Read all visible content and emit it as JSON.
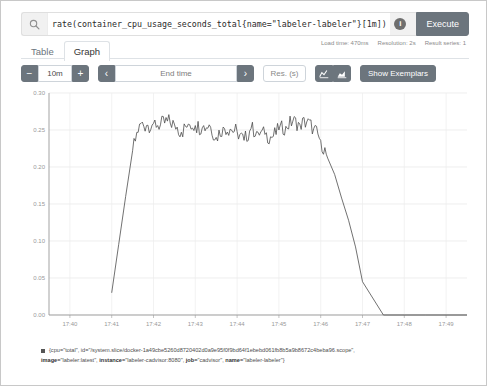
{
  "query": {
    "value": "rate(container_cpu_usage_seconds_total{name=\"labeler-labeler\"}[1m])",
    "search_icon": "search-icon",
    "info_icon": "i",
    "execute_label": "Execute"
  },
  "tabs": [
    {
      "label": "Table",
      "active": false
    },
    {
      "label": "Graph",
      "active": true
    }
  ],
  "stats": {
    "load_time": "Load time: 470ms",
    "resolution": "Resolution: 2s",
    "result_series": "Result series: 1"
  },
  "toolbar": {
    "decrease_label": "−",
    "range_value": "10m",
    "increase_label": "+",
    "prev_label": "‹",
    "end_time_placeholder": "End time",
    "next_label": "›",
    "resolution_placeholder": "Res. (s)",
    "line_chart_icon": "line-chart-icon",
    "stacked_chart_icon": "stacked-chart-icon",
    "show_exemplars_label": "Show Exemplars"
  },
  "legend": {
    "swatch_color": "#555555",
    "line1": "{cpu=\"total\", id=\"/system.slice/docker-1a49cbe5260d8720402d0a9e95f0f9bd64f1ebebd061fb8b5a9b8672c4beba96.scope\",",
    "line2_parts": [
      {
        "key": "image=",
        "val": "\"labeler:latest\", "
      },
      {
        "key": "instance=",
        "val": "\"labeler-cadvisor:8080\", "
      },
      {
        "key": "job=",
        "val": "\"cadvisor\", "
      },
      {
        "key": "name=",
        "val": "\"labeler-labeler\"}"
      }
    ]
  },
  "chart_data": {
    "type": "line",
    "title": "",
    "xlabel": "",
    "ylabel": "",
    "line_color": "#4d4d4d",
    "grid": true,
    "legend_position": "bottom",
    "ylim": [
      0.0,
      0.3
    ],
    "yticks": [
      "0.00",
      "0.05",
      "0.10",
      "0.15",
      "0.20",
      "0.25",
      "0.30"
    ],
    "ytick_values": [
      0.0,
      0.05,
      0.1,
      0.15,
      0.2,
      0.25,
      0.3
    ],
    "xlim": [
      "17:39:30",
      "17:49:30"
    ],
    "xticks": [
      "17:40",
      "17:41",
      "17:42",
      "17:43",
      "17:44",
      "17:45",
      "17:46",
      "17:47",
      "17:48",
      "17:49"
    ],
    "series": [
      {
        "name": "container_cpu_usage_seconds_total{name=\"labeler-labeler\"}",
        "x": [
          "17:41:00",
          "17:41:10",
          "17:41:20",
          "17:41:30",
          "17:41:40",
          "17:41:50",
          "17:42:00",
          "17:42:10",
          "17:42:20",
          "17:42:30",
          "17:42:40",
          "17:42:50",
          "17:43:00",
          "17:43:10",
          "17:43:20",
          "17:43:30",
          "17:43:40",
          "17:43:50",
          "17:44:00",
          "17:44:10",
          "17:44:20",
          "17:44:30",
          "17:44:40",
          "17:44:50",
          "17:45:00",
          "17:45:10",
          "17:45:20",
          "17:45:30",
          "17:45:40",
          "17:45:50",
          "17:46:00",
          "17:46:10",
          "17:46:20",
          "17:46:30",
          "17:46:40",
          "17:46:50",
          "17:47:00",
          "17:47:30",
          "17:48:00",
          "17:48:30",
          "17:49:00",
          "17:49:30"
        ],
        "values": [
          0.03,
          0.095,
          0.16,
          0.222,
          0.258,
          0.256,
          0.259,
          0.257,
          0.262,
          0.258,
          0.247,
          0.258,
          0.256,
          0.253,
          0.257,
          0.24,
          0.254,
          0.251,
          0.248,
          0.236,
          0.252,
          0.247,
          0.244,
          0.24,
          0.25,
          0.255,
          0.262,
          0.258,
          0.261,
          0.252,
          0.236,
          0.212,
          0.19,
          0.158,
          0.128,
          0.092,
          0.045,
          0.0,
          0.0,
          0.0,
          0.0,
          0.0
        ]
      }
    ]
  }
}
